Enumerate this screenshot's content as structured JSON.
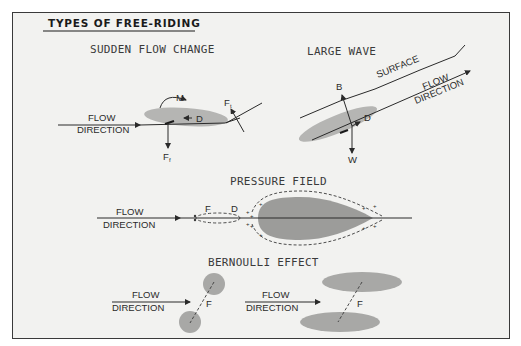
{
  "title": "TYPES OF FREE-RIDING",
  "colors": {
    "background": "#f2f2f0",
    "shape_light": "#b5b5b3",
    "shape_dark": "#9c9c9a",
    "ink": "#2a2a2a"
  },
  "panels": {
    "sudden_flow_change": {
      "heading": "SUDDEN FLOW CHANGE",
      "flow_label_1": "FLOW",
      "flow_label_2": "DIRECTION",
      "moment": "M",
      "drag": "D",
      "force_top": "F",
      "force_top_sub": "t",
      "force_bottom": "F",
      "force_bottom_sub": "f"
    },
    "large_wave": {
      "heading": "LARGE WAVE",
      "surface": "SURFACE",
      "flow_label_1": "FLOW",
      "flow_label_2": "DIRECTION",
      "buoyancy": "B",
      "drag": "D",
      "weight": "W"
    },
    "pressure_field": {
      "heading": "PRESSURE FIELD",
      "flow_label_1": "FLOW",
      "flow_label_2": "DIRECTION",
      "force": "F",
      "drag": "D",
      "plus": "+"
    },
    "bernoulli_effect": {
      "heading": "BERNOULLI EFFECT",
      "left": {
        "flow_label_1": "FLOW",
        "flow_label_2": "DIRECTION",
        "force": "F"
      },
      "right": {
        "flow_label_1": "FLOW",
        "flow_label_2": "DIRECTION",
        "force": "F"
      }
    }
  }
}
